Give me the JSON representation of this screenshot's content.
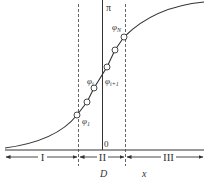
{
  "diagram": {
    "top_label": "π",
    "origin_label": "0",
    "x_axis_label": "x",
    "d_label": "D",
    "regions": [
      {
        "id": "I",
        "label": "I"
      },
      {
        "id": "II",
        "label": "II"
      },
      {
        "id": "III",
        "label": "III"
      }
    ],
    "nodes": [
      {
        "label_base": "φ",
        "label_sub": "1"
      },
      {
        "label_base": "",
        "label_sub": ""
      },
      {
        "label_base": "φ",
        "label_sub": "i"
      },
      {
        "label_base": "φ",
        "label_sub": "i+1"
      },
      {
        "label_base": "",
        "label_sub": ""
      },
      {
        "label_base": "φ",
        "label_sub": "N"
      }
    ],
    "colors": {
      "line": "#333333",
      "dashed": "#555555",
      "background": "#ffffff"
    }
  }
}
